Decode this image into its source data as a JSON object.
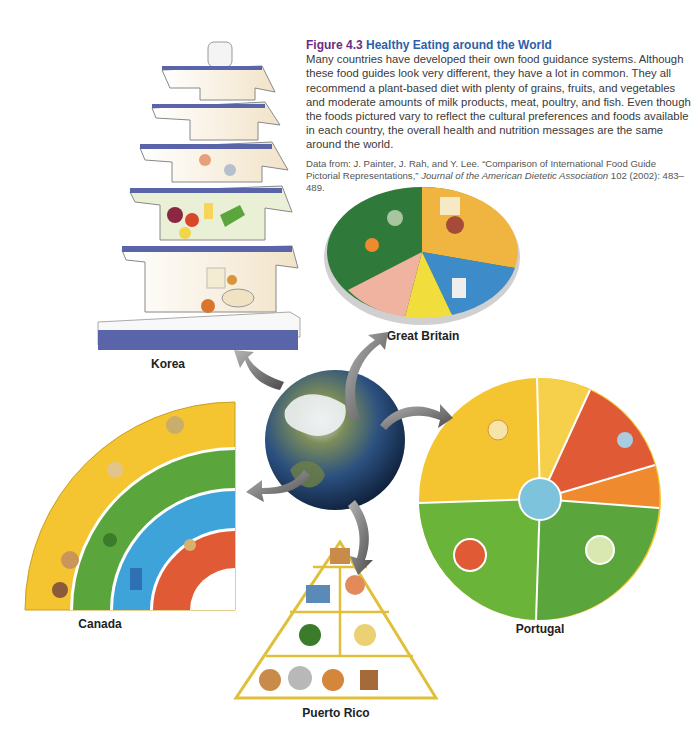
{
  "figure": {
    "number": "Figure 4.3",
    "title": "Healthy Eating around the World",
    "body": "Many countries have developed their own food guidance systems. Although these food guides look very different, they have a lot in common. They all recommend a plant-based diet with plenty of grains, fruits, and vegetables and moderate amounts of milk products, meat, poultry, and fish. Even though the foods pictured vary to reflect the cultural preferences and foods available in each country, the overall health and nutrition messages are the same around the world.",
    "source_prefix": "Data from: J. Painter, J. Rah, and Y. Lee. “Comparison of International Food Guide Pictorial Representations,” ",
    "source_journal": "Journal of the American Dietetic Association",
    "source_suffix": " 102 (2002): 483–489."
  },
  "guides": [
    {
      "country": "Korea",
      "shape": "pagoda"
    },
    {
      "country": "Great Britain",
      "shape": "plate"
    },
    {
      "country": "Canada",
      "shape": "rainbow"
    },
    {
      "country": "Portugal",
      "shape": "wheel"
    },
    {
      "country": "Puerto Rico",
      "shape": "pyramid"
    }
  ],
  "center": {
    "icon": "globe-icon"
  },
  "colors": {
    "figure_number": "#6b2d84",
    "figure_title": "#2f5fa8",
    "pagoda_trim": "#5a64a8",
    "yellow": "#f4c531",
    "green": "#5aa63c",
    "blue": "#3da3d9",
    "red": "#e05a35",
    "orange": "#ef8a2f"
  }
}
